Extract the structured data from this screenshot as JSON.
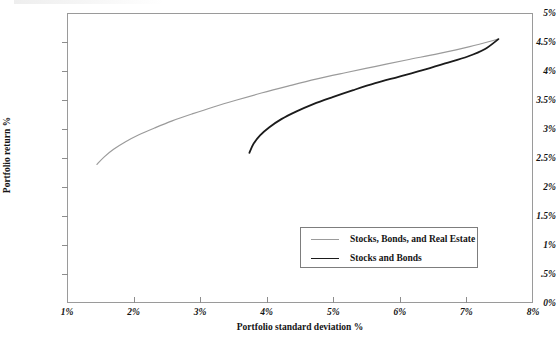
{
  "chart_data": {
    "type": "line",
    "title": "",
    "xlabel": "Portfolio standard deviation %",
    "ylabel": "Portfolio return %",
    "xlim": [
      1,
      8
    ],
    "ylim": [
      0,
      5
    ],
    "grid": false,
    "legend_position": "inside-bottom-center",
    "xticks": [
      "1%",
      "2%",
      "3%",
      "4%",
      "5%",
      "6%",
      "7%",
      "8%"
    ],
    "xtick_values": [
      1,
      2,
      3,
      4,
      5,
      6,
      7,
      8
    ],
    "yticks": [
      "0%",
      ".5%",
      "1%",
      "1.5%",
      "2%",
      "2.5%",
      "3%",
      "3.5%",
      "4%",
      "4.5%",
      "5%"
    ],
    "ytick_values": [
      0,
      0.5,
      1,
      1.5,
      2,
      2.5,
      3,
      3.5,
      4,
      4.5,
      5
    ],
    "series": [
      {
        "name": "Stocks, Bonds, and Real Estate",
        "color": "#9b9b9b",
        "width": 1.2,
        "points": [
          [
            1.45,
            2.39
          ],
          [
            1.56,
            2.52
          ],
          [
            1.7,
            2.65
          ],
          [
            1.88,
            2.78
          ],
          [
            2.08,
            2.9
          ],
          [
            2.32,
            3.02
          ],
          [
            2.58,
            3.14
          ],
          [
            2.88,
            3.26
          ],
          [
            3.2,
            3.38
          ],
          [
            3.55,
            3.5
          ],
          [
            3.92,
            3.62
          ],
          [
            4.32,
            3.74
          ],
          [
            4.74,
            3.86
          ],
          [
            5.18,
            3.97
          ],
          [
            5.64,
            4.08
          ],
          [
            6.1,
            4.19
          ],
          [
            6.58,
            4.3
          ],
          [
            7.05,
            4.42
          ],
          [
            7.48,
            4.55
          ]
        ]
      },
      {
        "name": "Stocks and Bonds",
        "color": "#1b1b1b",
        "width": 1.8,
        "points": [
          [
            3.74,
            2.59
          ],
          [
            3.8,
            2.74
          ],
          [
            3.9,
            2.89
          ],
          [
            4.04,
            3.03
          ],
          [
            4.22,
            3.17
          ],
          [
            4.44,
            3.3
          ],
          [
            4.7,
            3.43
          ],
          [
            4.99,
            3.55
          ],
          [
            5.3,
            3.67
          ],
          [
            5.63,
            3.79
          ],
          [
            5.98,
            3.9
          ],
          [
            6.33,
            4.01
          ],
          [
            6.68,
            4.13
          ],
          [
            7.02,
            4.25
          ],
          [
            7.28,
            4.38
          ],
          [
            7.48,
            4.55
          ]
        ]
      }
    ]
  },
  "legend": {
    "items": [
      {
        "label": "Stocks, Bonds, and Real Estate"
      },
      {
        "label": "Stocks and Bonds"
      }
    ]
  }
}
